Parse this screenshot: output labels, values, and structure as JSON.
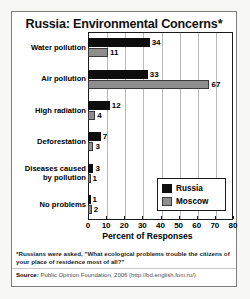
{
  "title": "Russia: Environmental Concerns*",
  "legend": {
    "series": [
      {
        "name": "Russia",
        "color": "#0d0d0d",
        "label": "Russia"
      },
      {
        "name": "Moscow",
        "color": "#8e8e8e",
        "label": "Moscow"
      }
    ]
  },
  "footnote": "*Russians were asked, \"What ecological problems trouble the citizens of your place of residence most of all?\"",
  "source_label": "Source:",
  "source_text": "Public Opinion Foundation, 2006 (http://bd.english.fom.ru/)",
  "xaxis_title": "Percent of Responses",
  "ticks": [
    "0",
    "10",
    "20",
    "30",
    "40",
    "50",
    "60",
    "70",
    "80"
  ],
  "categories_display": [
    "Water pollution",
    "Air pollution",
    "High radiation",
    "Deforestation",
    "Diseases caused<br>by pollution",
    "No problems"
  ],
  "values": {
    "russia": [
      "34",
      "33",
      "12",
      "7",
      "3",
      "1"
    ],
    "moscow": [
      "11",
      "67",
      "4",
      "3",
      "1",
      "2"
    ]
  },
  "chart_data": {
    "type": "bar",
    "orientation": "horizontal",
    "title": "Russia: Environmental Concerns*",
    "xlabel": "Percent of Responses",
    "ylabel": "",
    "xlim": [
      0,
      80
    ],
    "xticks": [
      0,
      10,
      20,
      30,
      40,
      50,
      60,
      70,
      80
    ],
    "grid": "vertical",
    "legend_position": "inside-bottom-right",
    "categories": [
      "Water pollution",
      "Air pollution",
      "High radiation",
      "Deforestation",
      "Diseases caused by pollution",
      "No problems"
    ],
    "series": [
      {
        "name": "Russia",
        "color": "#0d0d0d",
        "values": [
          34,
          33,
          12,
          7,
          3,
          1
        ]
      },
      {
        "name": "Moscow",
        "color": "#8e8e8e",
        "values": [
          11,
          67,
          4,
          3,
          1,
          2
        ]
      }
    ],
    "annotations": [
      "*Russians were asked, \"What ecological problems trouble the citizens of your place of residence most of all?\"",
      "Source: Public Opinion Foundation, 2006 (http://bd.english.fom.ru/)"
    ]
  }
}
